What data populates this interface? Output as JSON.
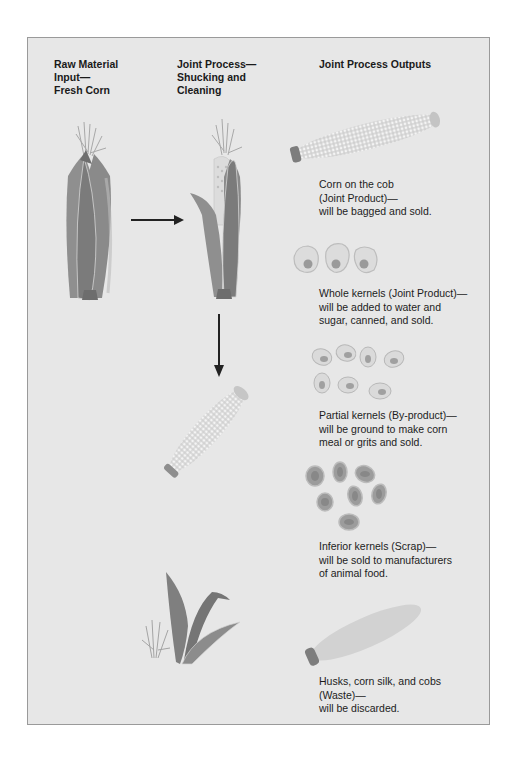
{
  "diagram": {
    "columns": [
      {
        "id": "raw-material",
        "lines": [
          "Raw Material",
          "Input—",
          "Fresh Corn"
        ]
      },
      {
        "id": "joint-process",
        "lines": [
          "Joint Process—",
          "Shucking and",
          "Cleaning"
        ]
      },
      {
        "id": "outputs",
        "lines": [
          "Joint Process Outputs"
        ]
      }
    ],
    "outputs": [
      {
        "id": "corn-on-cob",
        "lines": [
          "Corn on the cob",
          "(Joint Product)—",
          "will be bagged and sold."
        ],
        "category": "Joint Product"
      },
      {
        "id": "whole-kernels",
        "lines": [
          "Whole kernels (Joint Product)—",
          "will be added to water and",
          "sugar, canned, and sold."
        ],
        "category": "Joint Product"
      },
      {
        "id": "partial-kernels",
        "lines": [
          "Partial kernels (By-product)—",
          "will be ground to make corn",
          "meal or grits and sold."
        ],
        "category": "By-product"
      },
      {
        "id": "inferior-kernels",
        "lines": [
          "Inferior kernels (Scrap)—",
          "will be sold to manufacturers",
          "of animal food."
        ],
        "category": "Scrap"
      },
      {
        "id": "husks-waste",
        "lines": [
          "Husks, corn silk, and cobs",
          "(Waste)—",
          "will be discarded."
        ],
        "category": "Waste"
      }
    ],
    "colors": {
      "panel": "#e7e7e7",
      "border": "#9a9a9a",
      "husk_dark": "#7a7a7a",
      "husk_mid": "#8f8f8f",
      "kernel_light": "#f2f2f2",
      "arrow": "#222222"
    }
  }
}
